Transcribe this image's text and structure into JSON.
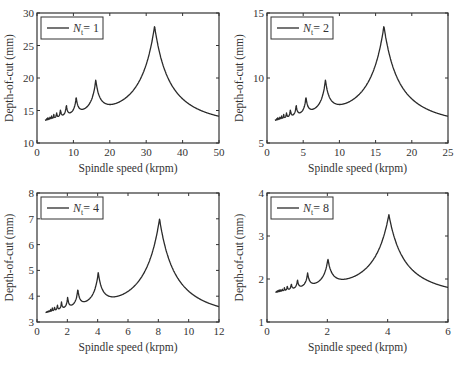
{
  "chart_data": [
    {
      "type": "line",
      "panel": "top-left",
      "legend": [
        {
          "label": "N_t = 1",
          "symbol": "N",
          "subscript": "t",
          "text": "= 1"
        }
      ],
      "xlabel": "Spindle speed (krpm)",
      "ylabel": "Depth-of-cut (mm)",
      "xlim": [
        0,
        50
      ],
      "ylim": [
        10,
        30
      ],
      "xticks": [
        0,
        10,
        20,
        30,
        40,
        50
      ],
      "yticks": [
        10,
        15,
        20,
        25,
        30
      ],
      "grid": false,
      "legend_position": "upper left",
      "lobe_base_speed": 32.3,
      "min_depth": 13.5,
      "peak_depth": 28.0,
      "x_start": 2.3,
      "peaks": [
        {
          "x": 32.3,
          "y": 28.0
        },
        {
          "x": 16.2,
          "y": 18.0
        },
        {
          "x": 10.8,
          "y": 15.5
        },
        {
          "x": 8.1,
          "y": 14.6
        },
        {
          "x": 6.5,
          "y": 14.2
        }
      ]
    },
    {
      "type": "line",
      "panel": "top-right",
      "legend": [
        {
          "label": "N_t = 2",
          "symbol": "N",
          "subscript": "t",
          "text": "= 2"
        }
      ],
      "xlabel": "Spindle speed (krpm)",
      "ylabel": "Depth-of-cut (mm)",
      "xlim": [
        0,
        25
      ],
      "ylim": [
        5,
        15
      ],
      "xticks": [
        0,
        5,
        10,
        15,
        20,
        25
      ],
      "yticks": [
        5,
        10,
        15
      ],
      "grid": false,
      "legend_position": "upper left",
      "lobe_base_speed": 16.15,
      "min_depth": 6.75,
      "peak_depth": 14.0,
      "x_start": 1.15,
      "peaks": [
        {
          "x": 16.15,
          "y": 14.0
        },
        {
          "x": 8.1,
          "y": 9.0
        },
        {
          "x": 5.4,
          "y": 7.8
        },
        {
          "x": 4.05,
          "y": 7.3
        },
        {
          "x": 3.25,
          "y": 7.1
        }
      ]
    },
    {
      "type": "line",
      "panel": "bottom-left",
      "legend": [
        {
          "label": "N_t = 4",
          "symbol": "N",
          "subscript": "t",
          "text": "= 4"
        }
      ],
      "xlabel": "Spindle speed (krpm)",
      "ylabel": "Depth-of-cut (mm)",
      "xlim": [
        0,
        12
      ],
      "ylim": [
        3,
        8
      ],
      "xticks": [
        0,
        2,
        4,
        6,
        8,
        10,
        12
      ],
      "yticks": [
        3,
        4,
        5,
        6,
        7,
        8
      ],
      "grid": false,
      "legend_position": "upper left",
      "lobe_base_speed": 8.08,
      "min_depth": 3.37,
      "peak_depth": 7.0,
      "x_start": 0.57,
      "peaks": [
        {
          "x": 8.08,
          "y": 7.0
        },
        {
          "x": 4.04,
          "y": 4.5
        },
        {
          "x": 2.7,
          "y": 3.9
        },
        {
          "x": 2.02,
          "y": 3.65
        },
        {
          "x": 1.62,
          "y": 3.55
        }
      ]
    },
    {
      "type": "line",
      "panel": "bottom-right",
      "legend": [
        {
          "label": "N_t = 8",
          "symbol": "N",
          "subscript": "t",
          "text": "= 8"
        }
      ],
      "xlabel": "Spindle speed (krpm)",
      "ylabel": "Depth-of-cut (mm)",
      "xlim": [
        0,
        6
      ],
      "ylim": [
        1,
        4
      ],
      "xticks": [
        0,
        2,
        4,
        6
      ],
      "yticks": [
        1,
        2,
        3,
        4
      ],
      "grid": false,
      "legend_position": "upper left",
      "lobe_base_speed": 4.04,
      "min_depth": 1.69,
      "peak_depth": 3.5,
      "x_start": 0.29,
      "peaks": [
        {
          "x": 4.04,
          "y": 3.5
        },
        {
          "x": 2.02,
          "y": 2.25
        },
        {
          "x": 1.35,
          "y": 1.95
        },
        {
          "x": 1.01,
          "y": 1.82
        },
        {
          "x": 0.81,
          "y": 1.78
        }
      ]
    }
  ],
  "panels": [
    {
      "legend_symbol": "N",
      "legend_sub": "t",
      "legend_value": "= 1",
      "xlabel": "Spindle speed (krpm)",
      "ylabel": "Depth-of-cut (mm)"
    },
    {
      "legend_symbol": "N",
      "legend_sub": "t",
      "legend_value": "= 2",
      "xlabel": "Spindle speed (krpm)",
      "ylabel": "Depth-of-cut (mm)"
    },
    {
      "legend_symbol": "N",
      "legend_sub": "t",
      "legend_value": "= 4",
      "xlabel": "Spindle speed (krpm)",
      "ylabel": "Depth-of-cut (mm)"
    },
    {
      "legend_symbol": "N",
      "legend_sub": "t",
      "legend_value": "= 8",
      "xlabel": "Spindle speed (krpm)",
      "ylabel": "Depth-of-cut (mm)"
    }
  ]
}
